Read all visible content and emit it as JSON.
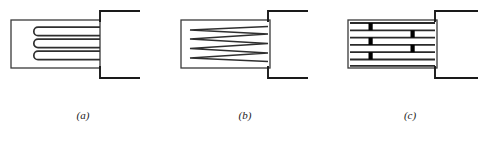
{
  "figure": {
    "background_color": "#ffffff",
    "stroke_color": "#3a3a3a",
    "stroke_color_dark": "#1a1a1a",
    "tab_fill_color": "#000000",
    "width": 494,
    "height": 142
  },
  "panels": [
    {
      "id": "a",
      "caption": "(a)",
      "type": "serpentine-wound-grid",
      "body": {
        "x": 11,
        "y": 20,
        "width": 89,
        "height": 48
      },
      "grid": {
        "style": "serpentine",
        "trace_count": 3,
        "trace_gap": 5,
        "trace_thickness": 1.6,
        "left_end": "rounded",
        "first_trace_y": 28,
        "trace_spacing": 10,
        "left_x": 33,
        "right_x": 100
      },
      "leads": {
        "top": {
          "x": 100,
          "y_body": 20,
          "y_out": 11,
          "x_out": 140
        },
        "bottom": {
          "x": 100,
          "y_body": 68,
          "y_out": 78,
          "x_out": 140
        }
      }
    },
    {
      "id": "b",
      "caption": "(b)",
      "type": "zigzag-wound-grid",
      "body": {
        "x": 181,
        "y": 20,
        "width": 89,
        "height": 48
      },
      "grid": {
        "style": "zigzag",
        "vertex_count_left": 3,
        "vertex_count_right": 4,
        "trace_thickness": 1.6,
        "left_x": 190,
        "right_x": 268,
        "top_y": 28,
        "bottom_y": 60
      },
      "leads": {
        "top": {
          "x": 268,
          "y_body": 20,
          "y_out": 11,
          "x_out": 308
        },
        "bottom": {
          "x": 268,
          "y_body": 68,
          "y_out": 78,
          "x_out": 308
        }
      }
    },
    {
      "id": "c",
      "caption": "(c)",
      "type": "foil-grid-with-tabs",
      "body": {
        "x": 348,
        "y": 20,
        "width": 89,
        "height": 48
      },
      "grid": {
        "style": "parallel-bars",
        "bar_count": 7,
        "bar_thickness": 1.6,
        "first_bar_y": 22,
        "bar_spacing": 7.3,
        "left_x": 350,
        "right_x": 435
      },
      "tabs": {
        "width": 4,
        "left_column_x": 370,
        "right_column_x": 412,
        "left_tab_rows": [
          1,
          3,
          5
        ],
        "right_tab_rows": [
          2,
          4
        ]
      },
      "leads": {
        "top": {
          "x": 435,
          "y_body": 20,
          "y_out": 11,
          "x_out": 478
        },
        "bottom": {
          "x": 435,
          "y_body": 68,
          "y_out": 78,
          "x_out": 478
        }
      }
    }
  ]
}
